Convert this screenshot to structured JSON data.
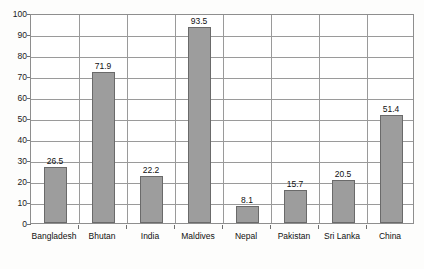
{
  "chart_data": {
    "type": "bar",
    "title": "",
    "subtitle": "",
    "xlabel": "",
    "ylabel": "",
    "ylim": [
      0,
      100
    ],
    "yticks": [
      0,
      10,
      20,
      30,
      40,
      50,
      60,
      70,
      80,
      90,
      100
    ],
    "ytick_labels": [
      "0",
      "10",
      "20",
      "30",
      "40",
      "50",
      "60",
      "70",
      "80",
      "90",
      "100"
    ],
    "grid": "horizontal-and-category-separators",
    "legend": "none",
    "categories": [
      "Bangladesh",
      "Bhutan",
      "India",
      "Maldives",
      "Nepal",
      "Pakistan",
      "Sri Lanka",
      "China"
    ],
    "values": [
      26.5,
      71.9,
      22.2,
      93.5,
      8.1,
      15.7,
      20.5,
      51.4
    ],
    "value_labels": [
      "26.5",
      "71.9",
      "22.2",
      "93.5",
      "8.1",
      "15.7",
      "20.5",
      "51.4"
    ],
    "series": [
      {
        "name": "",
        "values": [
          26.5,
          71.9,
          22.2,
          93.5,
          8.1,
          15.7,
          20.5,
          51.4
        ]
      }
    ],
    "colors": {
      "bar_fill": "#9d9d9d",
      "bar_edge": "#6a6a6a",
      "grid": "#9a9a9a",
      "frame": "#8e8e8e",
      "text": "#111111",
      "background": "#fdfdfc",
      "plot_background": "#ffffff"
    }
  }
}
